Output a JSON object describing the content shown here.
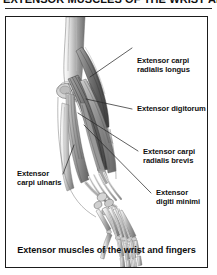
{
  "heading": {
    "text": "EXTENSOR MUSCLES OF THE WRIST AND FINGERS"
  },
  "figure": {
    "caption": "Extensor muscles of the wrist and fingers",
    "alt": "Grayscale anatomical illustration of the posterior right forearm and hand showing superficial extensor muscles, tendons and hand skeleton",
    "labels": [
      {
        "id": "extensor-carpi-radialis-longus",
        "line1": "Extensor carpi",
        "line2": "radialis longus"
      },
      {
        "id": "extensor-digitorum",
        "line1": "Extensor digitorum",
        "line2": ""
      },
      {
        "id": "extensor-carpi-radialis-brevis",
        "line1": "Extensor carpi",
        "line2": "radialis brevis"
      },
      {
        "id": "extensor-digiti-minimi",
        "line1": "Extensor",
        "line2": "digiti minimi"
      },
      {
        "id": "extensor-carpi-ulnaris",
        "line1": "Extensor",
        "line2": "carpi ulnaris"
      }
    ]
  },
  "colors": {
    "frame_border": "#1b1b1b",
    "rule": "#2a2a2a",
    "text": "#101010",
    "background": "#ffffff",
    "anatomy_dark": "#4a4a4a",
    "anatomy_mid": "#8c8c8c",
    "anatomy_light": "#c9c9c9"
  }
}
